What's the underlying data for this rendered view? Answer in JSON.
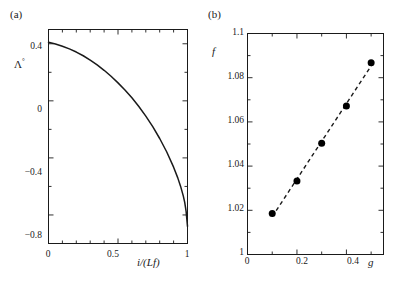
{
  "figure": {
    "background": "#ffffff",
    "ink": "#1a1a1a",
    "width": 399,
    "height": 287
  },
  "panels": [
    {
      "id": "a",
      "label": "(a)",
      "ylabel": "Λ",
      "ylabel_sup": "°",
      "xlabel": "i/(Lf)",
      "xlabel_parts": {
        "num": "i",
        "den": "(Lf)"
      }
    },
    {
      "id": "b",
      "label": "(b)",
      "ylabel": "f",
      "xlabel": "g"
    }
  ],
  "chart_data": [
    {
      "type": "line",
      "panel": "a",
      "title": "(a)",
      "xlabel": "i/(Lf)",
      "ylabel": "Λ°",
      "xlim": [
        0,
        1
      ],
      "ylim": [
        -1.0,
        0.5
      ],
      "grid": false,
      "legend": "none",
      "xticks": [
        0,
        0.5,
        1
      ],
      "xtick_labels": [
        "0",
        "0.5",
        "1"
      ],
      "xminor_ticks": [
        0.1,
        0.2,
        0.3,
        0.4,
        0.6,
        0.7,
        0.8,
        0.9
      ],
      "yticks": [
        0.4,
        0,
        -0.4,
        -0.8
      ],
      "ytick_labels": [
        "0.4",
        "0",
        "−0.4",
        "−0.8"
      ],
      "yminor_ticks": [
        0.2,
        -0.2,
        -0.6
      ],
      "line_style": "solid",
      "line_color": "#1a1a1a",
      "x": [
        0.0,
        0.05,
        0.1,
        0.15,
        0.2,
        0.25,
        0.3,
        0.35,
        0.4,
        0.45,
        0.5,
        0.55,
        0.6,
        0.65,
        0.7,
        0.75,
        0.8,
        0.85,
        0.9,
        0.93,
        0.95,
        0.97,
        0.98,
        0.99,
        1.0
      ],
      "y": [
        0.41,
        0.398,
        0.383,
        0.364,
        0.342,
        0.316,
        0.286,
        0.252,
        0.214,
        0.172,
        0.126,
        0.076,
        0.021,
        -0.04,
        -0.107,
        -0.181,
        -0.264,
        -0.357,
        -0.465,
        -0.54,
        -0.598,
        -0.668,
        -0.712,
        -0.775,
        -0.88
      ]
    },
    {
      "type": "scatter",
      "panel": "b",
      "title": "(b)",
      "xlabel": "g",
      "ylabel": "f",
      "xlim": [
        0,
        0.55
      ],
      "ylim": [
        1.0,
        1.1
      ],
      "grid": false,
      "legend": "none",
      "xticks": [
        0,
        0.2,
        0.4
      ],
      "xtick_labels": [
        "0",
        "0.2",
        "0.4"
      ],
      "xminor_ticks": [
        0.1,
        0.3,
        0.5
      ],
      "yticks": [
        1.0,
        1.02,
        1.04,
        1.06,
        1.08,
        1.1
      ],
      "ytick_labels": [
        "1",
        "1.02",
        "1.04",
        "1.06",
        "1.08",
        "1.1"
      ],
      "yminor_ticks": [
        1.01,
        1.03,
        1.05,
        1.07,
        1.09
      ],
      "marker": "filled-circle",
      "marker_color": "#000000",
      "marker_size": 7,
      "fit_line_style": "dashed",
      "fit_line_color": "#1a1a1a",
      "x": [
        0.1,
        0.2,
        0.3,
        0.4,
        0.5
      ],
      "y": [
        1.0185,
        1.0333,
        1.0503,
        1.0672,
        1.0868
      ]
    }
  ]
}
